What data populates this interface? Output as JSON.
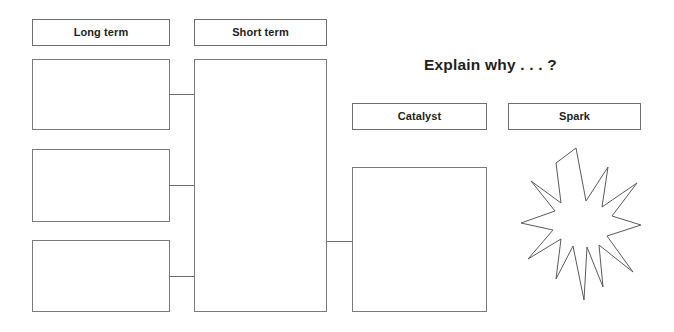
{
  "page": {
    "background_color": "#ffffff",
    "border_color": "#6e6e6e",
    "text_color": "#231f20",
    "width": 674,
    "height": 332
  },
  "left_column": {
    "header_label": "Long term",
    "entry_boxes": [
      {
        "value": "",
        "placeholder": ""
      },
      {
        "value": "",
        "placeholder": ""
      },
      {
        "value": "",
        "placeholder": ""
      }
    ]
  },
  "center_column": {
    "header_label": "Short term",
    "entry_box": {
      "value": "",
      "placeholder": ""
    }
  },
  "right_section": {
    "prompt": "Explain why . . . ?",
    "catalyst": {
      "header_label": "Catalyst",
      "entry_box": {
        "value": "",
        "placeholder": ""
      }
    },
    "spark": {
      "header_label": "Spark",
      "burst_icon": "star-burst-icon",
      "burst_points": 12
    }
  },
  "connectors": [
    {
      "name": "long-term-1-to-short-term"
    },
    {
      "name": "long-term-2-to-short-term"
    },
    {
      "name": "long-term-3-to-short-term"
    },
    {
      "name": "short-term-to-catalyst"
    }
  ]
}
